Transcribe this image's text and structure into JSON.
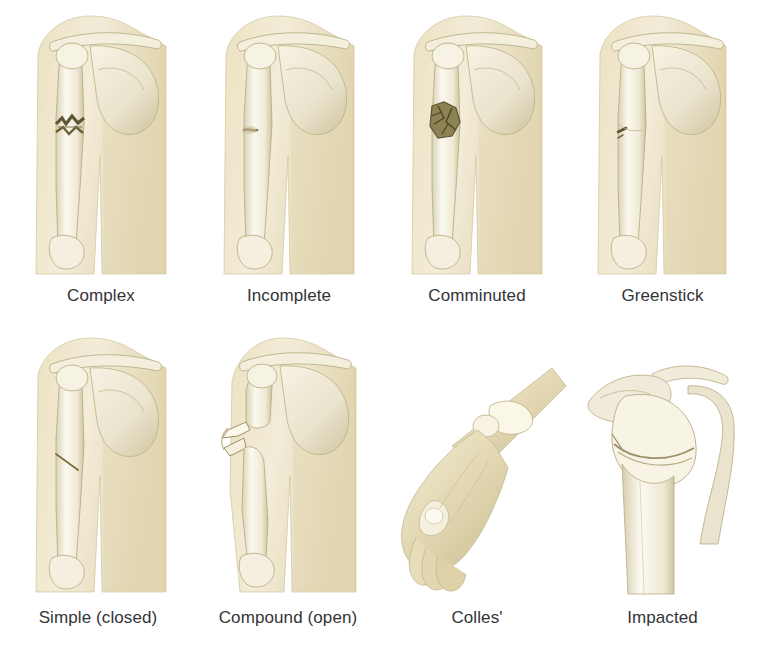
{
  "figure": {
    "background_color": "#ffffff",
    "label_color": "#333436",
    "palette": {
      "soft_tissue_light": "#f4ecd5",
      "soft_tissue_mid": "#e6dcbb",
      "soft_tissue_shadow": "#cfc49c",
      "bone_light": "#fbf8ec",
      "bone_mid": "#efead5",
      "bone_shadow": "#d6cfb0",
      "bone_outline": "#b3a87e",
      "fracture_dark": "#5d5434"
    },
    "layout": {
      "rows": 2,
      "columns": 4,
      "total_panels": 8
    }
  },
  "panels": [
    {
      "id": "complex",
      "label": "Complex",
      "row": 1,
      "column": 1,
      "view": "anterior shoulder and upper arm",
      "bones_shown": [
        "clavicle",
        "scapula",
        "humerus"
      ],
      "fracture_site": "mid humeral shaft",
      "fracture_description": "jagged displaced break with multiple fragment edges"
    },
    {
      "id": "incomplete",
      "label": "Incomplete",
      "row": 1,
      "column": 2,
      "view": "anterior shoulder and upper arm",
      "bones_shown": [
        "clavicle",
        "scapula",
        "humerus"
      ],
      "fracture_site": "upper humeral shaft",
      "fracture_description": "partial crack that does not cross the full bone width"
    },
    {
      "id": "comminuted",
      "label": "Comminuted",
      "row": 1,
      "column": 3,
      "view": "anterior shoulder and upper arm",
      "bones_shown": [
        "clavicle",
        "scapula",
        "humerus"
      ],
      "fracture_site": "upper humeral shaft",
      "fracture_description": "shattered zone broken into several small fragments"
    },
    {
      "id": "greenstick",
      "label": "Greenstick",
      "row": 1,
      "column": 4,
      "view": "anterior shoulder and upper arm",
      "bones_shown": [
        "clavicle",
        "scapula",
        "humerus"
      ],
      "fracture_site": "mid humeral shaft",
      "fracture_description": "bone bent with a small crack on the convex side only"
    },
    {
      "id": "simple-closed",
      "label": "Simple (closed)",
      "row": 2,
      "column": 1,
      "view": "anterior shoulder and upper arm",
      "bones_shown": [
        "clavicle",
        "scapula",
        "humerus"
      ],
      "fracture_site": "mid humeral shaft",
      "fracture_description": "clean oblique break with skin intact"
    },
    {
      "id": "compound-open",
      "label": "Compound (open)",
      "row": 2,
      "column": 2,
      "view": "anterior shoulder and upper arm",
      "bones_shown": [
        "clavicle",
        "scapula",
        "humerus"
      ],
      "fracture_site": "upper humeral shaft",
      "fracture_description": "displaced bone ends piercing through the skin"
    },
    {
      "id": "colles",
      "label": "Colles'",
      "row": 2,
      "column": 3,
      "view": "lateral hand and wrist",
      "bones_shown": [
        "radius",
        "ulna",
        "carpals"
      ],
      "fracture_site": "distal radius",
      "fracture_description": "dorsally angulated dinner-fork wrist deformity"
    },
    {
      "id": "impacted",
      "label": "Impacted",
      "row": 2,
      "column": 4,
      "view": "anterior shoulder close-up",
      "bones_shown": [
        "clavicle",
        "scapula",
        "humerus"
      ],
      "fracture_site": "proximal humerus / surgical neck",
      "fracture_description": "humeral head driven down and telescoped into the shaft"
    }
  ]
}
